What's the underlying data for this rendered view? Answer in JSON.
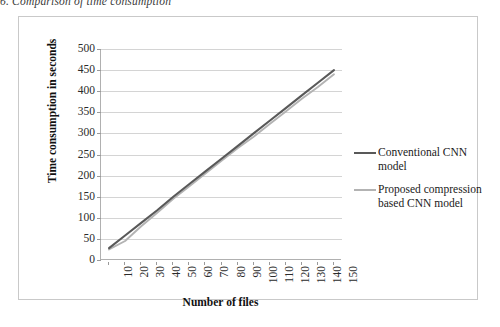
{
  "caption": "6. Comparison of time consumption",
  "chart_data": {
    "type": "line",
    "title": "",
    "xlabel": "Number of files",
    "ylabel": "Time consumption in seconds",
    "categories": [
      10,
      20,
      30,
      40,
      50,
      60,
      70,
      80,
      90,
      100,
      110,
      120,
      130,
      140,
      150
    ],
    "xtick_labels": [
      "10",
      "20",
      "30",
      "40",
      "50",
      "60",
      "70",
      "80",
      "90",
      "100",
      "110",
      "120",
      "130",
      "140",
      "150"
    ],
    "ytick_labels": [
      "0",
      "50",
      "100",
      "150",
      "200",
      "250",
      "300",
      "350",
      "400",
      "450",
      "500"
    ],
    "ylim": [
      0,
      500
    ],
    "ytick_step": 50,
    "grid": true,
    "legend_position": "right",
    "series": [
      {
        "name": "Conventional CNN model",
        "color": "#595959",
        "values": [
          28,
          58,
          88,
          118,
          150,
          180,
          210,
          240,
          270,
          300,
          330,
          360,
          390,
          420,
          450
        ]
      },
      {
        "name": "Proposed compression based CNN model",
        "color": "#b3b3b3",
        "values": [
          25,
          45,
          80,
          112,
          145,
          175,
          205,
          235,
          265,
          292,
          322,
          352,
          382,
          410,
          440
        ]
      }
    ]
  },
  "colors": {
    "series_1": "#595959",
    "series_2": "#b3b3b3",
    "gridline": "#d4d4d4",
    "axis": "#b0b0b0",
    "frame": "#c9c9c9"
  }
}
